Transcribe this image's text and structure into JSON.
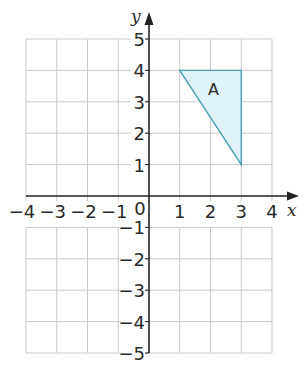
{
  "diagram": {
    "type": "coordinate-grid",
    "x_axis": {
      "label": "x",
      "min": -4,
      "max": 4,
      "ticks": [
        "-4",
        "-3",
        "-2",
        "-1",
        "1",
        "2",
        "3",
        "4"
      ]
    },
    "y_axis": {
      "label": "y",
      "min": -5,
      "max": 5,
      "ticks_positive": [
        "5",
        "4",
        "3",
        "2",
        "1"
      ],
      "ticks_negative": [
        "-1",
        "-2",
        "-3",
        "-4",
        "-5"
      ]
    },
    "origin_label": "0",
    "shapes": [
      {
        "name": "A",
        "kind": "triangle",
        "vertices": [
          [
            1,
            4
          ],
          [
            3,
            4
          ],
          [
            3,
            1
          ]
        ],
        "fill": "#dff3f8",
        "stroke": "#4a9fb3"
      }
    ],
    "colors": {
      "grid": "#c9c9c9",
      "axis": "#222222",
      "text": "#2a2a2a"
    }
  }
}
